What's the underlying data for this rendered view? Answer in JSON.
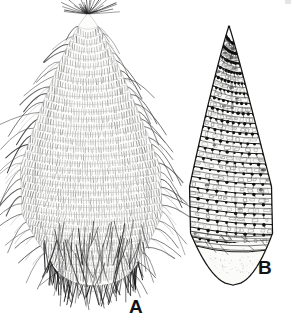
{
  "figure": {
    "kind": "scientific-line-illustration",
    "background_color": "#ffffff",
    "ink_color": "#1a1a1a",
    "canvas": {
      "width": 292,
      "height": 330
    },
    "panels": [
      {
        "id": "A",
        "label": "A",
        "label_position": {
          "x": 129,
          "y": 297
        },
        "description": "lanceolate body densely clothed in transverse rows of fine setae, long curved marginal bristles, apical crown of radiating setae, densely setose rounded base",
        "outline": {
          "apex": {
            "x": 88,
            "y": 14
          },
          "base": {
            "x": 92,
            "y": 292
          },
          "left_max": {
            "x": 22,
            "y": 175
          },
          "right_max": {
            "x": 162,
            "y": 170
          }
        },
        "transverse_rows": 34,
        "marginal_setae_left": 30,
        "marginal_setae_right": 30,
        "apical_setae": 22,
        "basal_setae": 58
      },
      {
        "id": "B",
        "label": "B",
        "label_position": {
          "x": 258,
          "y": 258
        },
        "description": "ovoid body marked by oblique spiral bands bearing regularly spaced dark tubercles, smooth rounded unsculptured basal cap",
        "outline": {
          "apex": {
            "x": 228,
            "y": 26
          },
          "base": {
            "x": 230,
            "y": 285
          },
          "left_max": {
            "x": 190,
            "y": 180
          },
          "right_max": {
            "x": 272,
            "y": 175
          }
        },
        "spiral_bands": 21,
        "tubercles_per_band": 9,
        "smooth_base_top_y": 243
      }
    ]
  },
  "colors": {
    "ink": "#1a1a1a",
    "mid_ink": "#4a4a4a",
    "light_ink": "#8a8a8a",
    "fill_light": "#f7f7f5",
    "fill_shadow": "#e8e8e6",
    "background": "#ffffff"
  },
  "labels": {
    "panel_a": "A",
    "panel_b": "B"
  }
}
